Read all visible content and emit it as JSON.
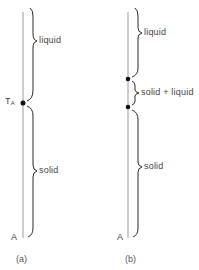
{
  "panels": [
    {
      "id": "a",
      "caption": "(a)",
      "axis_label": "A",
      "point_label": "T",
      "point_label_sub": "A",
      "regions": [
        {
          "label": "liquid"
        },
        {
          "label": "solid"
        }
      ]
    },
    {
      "id": "b",
      "caption": "(b)",
      "axis_label": "A",
      "regions": [
        {
          "label": "liquid"
        },
        {
          "label": "solid + liquid"
        },
        {
          "label": "solid"
        }
      ]
    }
  ],
  "colors": {
    "line": "#9a9a9a",
    "brace": "#2a2a2a",
    "dot": "#111111"
  }
}
